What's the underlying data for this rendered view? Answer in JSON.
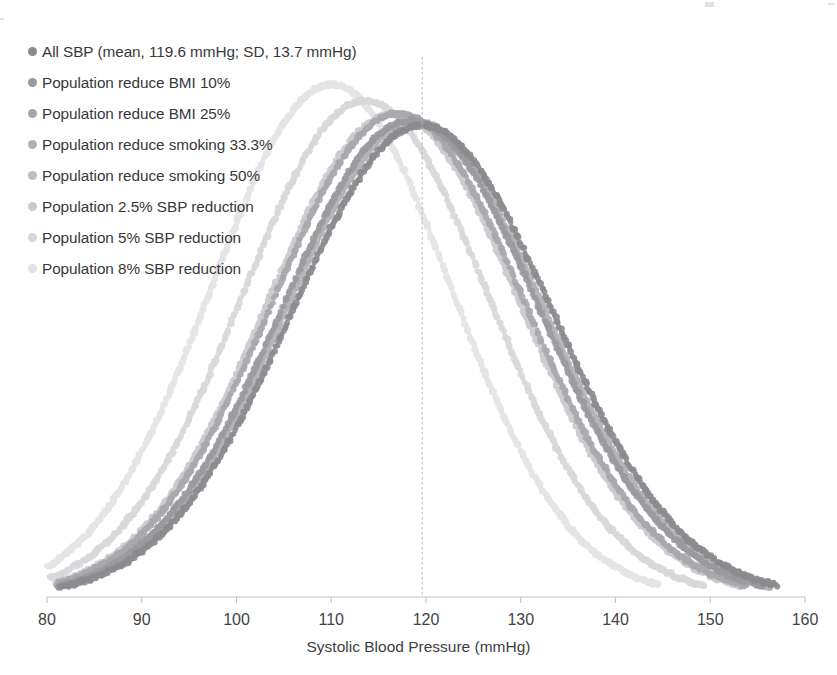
{
  "chart_data": {
    "type": "scatter",
    "title": "",
    "xlabel": "Systolic Blood Pressure (mmHg)",
    "ylabel": "",
    "xlim": [
      80,
      160
    ],
    "xticks": [
      80,
      90,
      100,
      110,
      120,
      130,
      140,
      150,
      160
    ],
    "xtick_labels": [
      "80",
      "90",
      "100",
      "110",
      "120",
      "130",
      "140",
      "150",
      "160"
    ],
    "ylim": [
      0,
      0.032
    ],
    "grid": false,
    "legend_position": "upper-left",
    "reference_line": {
      "axis": "x",
      "value": 119.6,
      "style": "dashed",
      "color": "#b9b9bd",
      "label": "mean 119.6 mmHg"
    },
    "series": [
      {
        "name": "All SBP (mean, 119.6 mmHg; SD, 13.7 mmHg)",
        "mean": 119.6,
        "sd": 13.7,
        "peak_y": 0.0291,
        "color": "#8c8c90",
        "marker": "circle",
        "x_range": [
          81.5,
          157.0
        ]
      },
      {
        "name": "Population reduce BMI 10%",
        "mean": 118.4,
        "sd": 13.55,
        "peak_y": 0.0294,
        "color": "#9b9b9f",
        "marker": "circle",
        "x_range": [
          81.2,
          155.6
        ]
      },
      {
        "name": "Population reduce BMI 25%",
        "mean": 117.1,
        "sd": 13.4,
        "peak_y": 0.0298,
        "color": "#a9a9ad",
        "marker": "circle",
        "x_range": [
          81.0,
          153.9
        ]
      },
      {
        "name": "Population reduce smoking 33.3%",
        "mean": 118.9,
        "sd": 13.6,
        "peak_y": 0.0293,
        "color": "#b4b4b8",
        "marker": "circle",
        "x_range": [
          81.4,
          156.3
        ]
      },
      {
        "name": "Population reduce smoking 50%",
        "mean": 118.6,
        "sd": 13.58,
        "peak_y": 0.0293,
        "color": "#c0c0c4",
        "marker": "circle",
        "x_range": [
          81.3,
          155.9
        ]
      },
      {
        "name": "Population 2.5% SBP reduction",
        "mean": 116.6,
        "sd": 13.36,
        "peak_y": 0.0298,
        "color": "#cbcbcf",
        "marker": "circle",
        "x_range": [
          80.9,
          153.3
        ]
      },
      {
        "name": "Population 5% SBP reduction",
        "mean": 113.6,
        "sd": 13.0,
        "peak_y": 0.0306,
        "color": "#d8d8dc",
        "marker": "circle",
        "x_range": [
          80.3,
          149.4
        ]
      },
      {
        "name": "Population 8% SBP reduction",
        "mean": 110.0,
        "sd": 12.6,
        "peak_y": 0.0316,
        "color": "#e4e4e8",
        "marker": "circle",
        "x_range": [
          80.0,
          144.5
        ]
      }
    ]
  },
  "axis": {
    "x_title": "Systolic Blood Pressure (mmHg)",
    "tick_labels": [
      "80",
      "90",
      "100",
      "110",
      "120",
      "130",
      "140",
      "150",
      "160"
    ]
  },
  "legend": {
    "items": [
      {
        "label": "All SBP (mean, 119.6 mmHg; SD, 13.7 mmHg)",
        "color": "#8a8a8e"
      },
      {
        "label": "Population reduce BMI 10%",
        "color": "#9a9a9e"
      },
      {
        "label": "Population reduce BMI 25%",
        "color": "#a6a6aa"
      },
      {
        "label": "Population reduce smoking 33.3%",
        "color": "#b2b2b6"
      },
      {
        "label": "Population reduce smoking 50%",
        "color": "#bfbfc3"
      },
      {
        "label": "Population 2.5% SBP reduction",
        "color": "#cacace"
      },
      {
        "label": "Population 5% SBP reduction",
        "color": "#d7d7db"
      },
      {
        "label": "Population 8% SBP reduction",
        "color": "#e3e3e7"
      }
    ]
  }
}
